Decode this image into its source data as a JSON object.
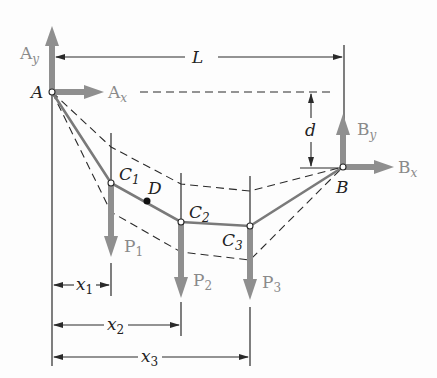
{
  "diagram": {
    "type": "cable-with-concentrated-loads",
    "colors": {
      "force_arrow": "#8f8f8f",
      "cable": "#7a7a7a",
      "line": "#2a2a2a",
      "background": "#fdfdfd"
    },
    "points": {
      "A": {
        "label": "A",
        "x": 52,
        "y": 92
      },
      "B": {
        "label": "B",
        "x": 343,
        "y": 167
      },
      "C1": {
        "label": "C",
        "sub": "1",
        "x": 111,
        "y": 183
      },
      "C2": {
        "label": "C",
        "sub": "2",
        "x": 181,
        "y": 222
      },
      "C3": {
        "label": "C",
        "sub": "3",
        "x": 250,
        "y": 226
      },
      "D": {
        "label": "D",
        "x": 147,
        "y": 201
      }
    },
    "forces": {
      "Ay": {
        "label": "A",
        "sub": "y"
      },
      "Ax": {
        "label": "A",
        "sub": "x"
      },
      "By": {
        "label": "B",
        "sub": "y"
      },
      "Bx": {
        "label": "B",
        "sub": "x"
      },
      "P1": {
        "label": "P",
        "sub": "1"
      },
      "P2": {
        "label": "P",
        "sub": "2"
      },
      "P3": {
        "label": "P",
        "sub": "3"
      }
    },
    "dimensions": {
      "L": {
        "label": "L"
      },
      "d": {
        "label": "d"
      },
      "x1": {
        "label": "x",
        "sub": "1"
      },
      "x2": {
        "label": "x",
        "sub": "2"
      },
      "x3": {
        "label": "x",
        "sub": "3"
      }
    }
  }
}
